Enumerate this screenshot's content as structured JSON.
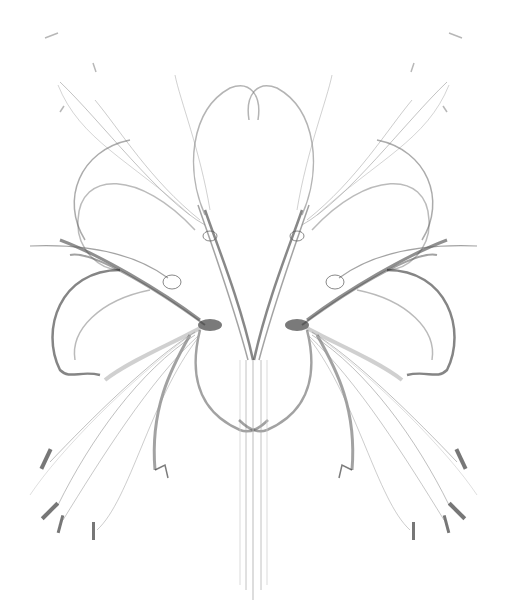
{
  "image": {
    "subject": "X-ray style symmetric composition of spider lily flowers",
    "background_color": "#ffffff",
    "stroke_color": "#3a3a3a",
    "width": 507,
    "height": 612
  }
}
